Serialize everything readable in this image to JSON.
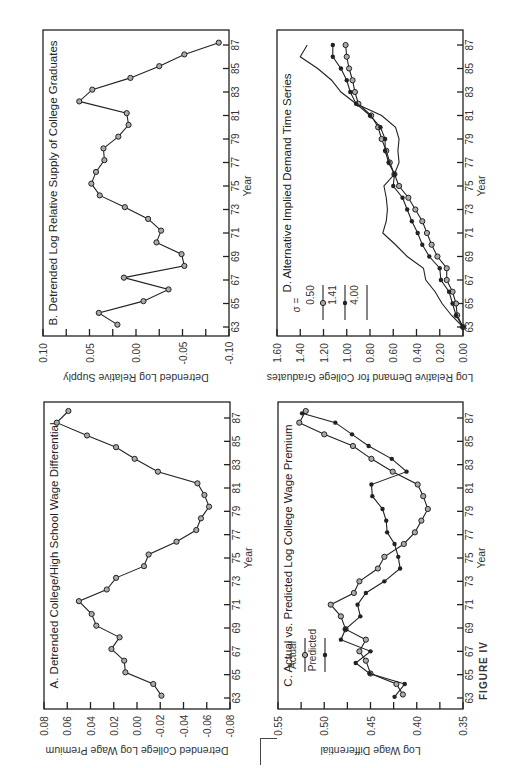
{
  "figure_label": "FIGURE IV",
  "chart_data": [
    {
      "id": "A",
      "type": "line",
      "title": "A. Detrended College/High School Wage Differential",
      "xlabel": "Year",
      "ylabel": "Detrended College Log Wage Premium",
      "xticks": [
        "63",
        "65",
        "67",
        "69",
        "71",
        "73",
        "75",
        "77",
        "79",
        "81",
        "83",
        "85",
        "87"
      ],
      "yticks": [
        "0.08",
        "0.06",
        "0.04",
        "0.02",
        "0.00",
        "-0.02",
        "-0.04",
        "-0.06",
        "-0.08"
      ],
      "ylim": [
        -0.08,
        0.08
      ],
      "x": [
        63.2,
        64.2,
        65.2,
        66.2,
        67.2,
        68.2,
        69.2,
        70.2,
        71.3,
        72.3,
        73.3,
        74.3,
        75.3,
        76.4,
        77.4,
        78.4,
        79.4,
        80.4,
        81.4,
        82.4,
        83.5,
        84.5,
        85.5,
        86.6,
        87.6
      ],
      "series": [
        {
          "name": "Detrended premium",
          "marker": "open-circle",
          "values": [
            -0.021,
            -0.014,
            0.01,
            0.011,
            0.022,
            0.015,
            0.035,
            0.039,
            0.05,
            0.026,
            0.018,
            -0.006,
            -0.01,
            -0.034,
            -0.051,
            -0.055,
            -0.062,
            -0.058,
            -0.052,
            -0.018,
            0.002,
            0.018,
            0.043,
            0.069,
            0.059
          ]
        }
      ]
    },
    {
      "id": "B",
      "type": "line",
      "title": "B. Detrended Log Relative Supply of College Graduates",
      "xlabel": "Year",
      "ylabel": "Detrended Log Relative Supply",
      "xticks": [
        "63",
        "65",
        "67",
        "69",
        "71",
        "73",
        "75",
        "77",
        "79",
        "81",
        "83",
        "85",
        "87"
      ],
      "yticks": [
        "0.10",
        "0.05",
        "0.00",
        "-0.05",
        "-0.10"
      ],
      "ylim": [
        -0.1,
        0.1
      ],
      "x": [
        63.2,
        64.2,
        65.2,
        66.2,
        67.2,
        68.2,
        69.2,
        70.2,
        71.2,
        72.2,
        73.2,
        74.2,
        75.2,
        76.2,
        77.2,
        78.2,
        79.2,
        80.2,
        81.2,
        82.2,
        83.2,
        84.2,
        85.2,
        86.2,
        87.2
      ],
      "series": [
        {
          "name": "Detrended supply",
          "marker": "open-circle",
          "values": [
            0.02,
            0.04,
            -0.008,
            -0.035,
            0.013,
            -0.052,
            -0.049,
            -0.022,
            -0.027,
            -0.013,
            0.012,
            0.039,
            0.048,
            0.043,
            0.034,
            0.035,
            0.019,
            0.008,
            0.01,
            0.061,
            0.047,
            0.006,
            -0.025,
            -0.052,
            -0.089
          ]
        }
      ]
    },
    {
      "id": "C",
      "type": "line",
      "title": "C. Actual vs. Predicted Log College Wage Premium",
      "xlabel": "Year",
      "ylabel": "Log Wage Differential",
      "xticks": [
        "63",
        "65",
        "67",
        "69",
        "71",
        "73",
        "75",
        "77",
        "79",
        "81",
        "83",
        "85",
        "87"
      ],
      "yticks": [
        "0.55",
        "0.50",
        "0.45",
        "0.40",
        "0.35"
      ],
      "ylim": [
        0.35,
        0.55
      ],
      "legend": [
        "Actual",
        "Predicted"
      ],
      "series": [
        {
          "name": "Actual",
          "marker": "open-circle",
          "x": [
            63.3,
            64.2,
            65.1,
            66.2,
            67.0,
            68.0,
            68.9,
            70.0,
            71.0,
            72.0,
            73.0,
            74.1,
            75.1,
            76.2,
            77.2,
            78.2,
            79.2,
            80.3,
            81.3,
            82.4,
            83.5,
            84.6,
            85.6,
            86.6,
            87.6
          ],
          "values": [
            0.415,
            0.422,
            0.45,
            0.455,
            0.462,
            0.455,
            0.477,
            0.482,
            0.493,
            0.468,
            0.462,
            0.442,
            0.435,
            0.414,
            0.402,
            0.395,
            0.388,
            0.393,
            0.399,
            0.426,
            0.449,
            0.469,
            0.5,
            0.527,
            0.52
          ]
        },
        {
          "name": "Predicted",
          "marker": "filled-circle",
          "x": [
            63.1,
            64.2,
            65.1,
            66.0,
            67.0,
            68.0,
            68.9,
            70.0,
            71.0,
            72.0,
            73.0,
            74.1,
            75.1,
            76.2,
            77.2,
            78.2,
            79.2,
            80.3,
            81.3,
            82.4,
            83.5,
            84.6,
            85.6,
            86.6,
            87.4
          ],
          "values": [
            0.424,
            0.413,
            0.451,
            0.466,
            0.45,
            0.482,
            0.477,
            0.461,
            0.464,
            0.455,
            0.435,
            0.418,
            0.42,
            0.424,
            0.432,
            0.433,
            0.437,
            0.448,
            0.449,
            0.411,
            0.427,
            0.452,
            0.47,
            0.488,
            0.524
          ]
        }
      ]
    },
    {
      "id": "D",
      "type": "line",
      "title": "D. Alternative Implied Demand Time Series",
      "xlabel": "Year",
      "ylabel": "Log Relative Demand for College Graduates",
      "xticks": [
        "63",
        "65",
        "67",
        "69",
        "71",
        "73",
        "75",
        "77",
        "79",
        "81",
        "83",
        "85",
        "87"
      ],
      "yticks": [
        "1.60",
        "1.40",
        "1.20",
        "1.00",
        "0.80",
        "0.60",
        "0.40",
        "0.20",
        "0.00"
      ],
      "ylim": [
        0.0,
        1.6
      ],
      "legend_title": "σ =",
      "legend": [
        "0.50",
        "1.41",
        "4.00"
      ],
      "x": [
        63,
        64,
        65,
        66,
        67,
        68,
        69,
        70,
        71,
        72,
        73,
        74,
        75,
        76,
        77,
        78,
        79,
        80,
        81,
        82,
        83,
        84,
        85,
        86,
        87
      ],
      "series": [
        {
          "name": "0.50",
          "marker": "open-circle",
          "values": [
            0.0,
            0.05,
            0.06,
            0.09,
            0.14,
            0.14,
            0.22,
            0.27,
            0.31,
            0.35,
            0.41,
            0.47,
            0.55,
            0.59,
            0.63,
            0.66,
            0.7,
            0.73,
            0.79,
            0.9,
            0.93,
            0.95,
            0.98,
            1.0,
            1.01
          ]
        },
        {
          "name": "1.41",
          "marker": "filled-circle",
          "values": [
            0.0,
            0.06,
            0.09,
            0.12,
            0.19,
            0.2,
            0.29,
            0.35,
            0.39,
            0.44,
            0.48,
            0.52,
            0.6,
            0.59,
            0.64,
            0.67,
            0.67,
            0.71,
            0.8,
            0.92,
            0.97,
            1.0,
            1.05,
            1.12,
            1.12
          ]
        },
        {
          "name": "4.00",
          "marker": "none",
          "values": [
            0.0,
            0.1,
            0.18,
            0.24,
            0.32,
            0.34,
            0.48,
            0.58,
            0.69,
            0.66,
            0.65,
            0.66,
            0.68,
            0.59,
            0.55,
            0.56,
            0.55,
            0.58,
            0.7,
            0.92,
            1.05,
            1.13,
            1.25,
            1.4,
            1.34
          ]
        }
      ]
    }
  ]
}
